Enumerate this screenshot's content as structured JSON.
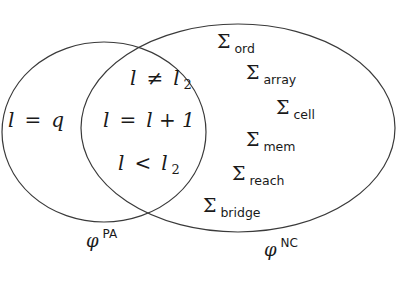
{
  "diagram": {
    "type": "venn",
    "sets": [
      {
        "name": "phi_PA",
        "label_base": "φ",
        "label_sup": "PA",
        "exclusive_members": [
          "l = q"
        ]
      },
      {
        "name": "phi_NC",
        "label_base": "φ",
        "label_sup": "NC",
        "exclusive_members": [
          {
            "base": "Σ",
            "sub": "ord"
          },
          {
            "base": "Σ",
            "sub": "array"
          },
          {
            "base": "Σ",
            "sub": "cell"
          },
          {
            "base": "Σ",
            "sub": "mem"
          },
          {
            "base": "Σ",
            "sub": "reach"
          },
          {
            "base": "Σ",
            "sub": "bridge"
          }
        ]
      }
    ],
    "intersection": [
      {
        "lhs": "l",
        "op": "≠",
        "rhs": "l",
        "rhs_sub": "2"
      },
      {
        "lhs": "l",
        "op": "=",
        "rhs": "l + 1",
        "rhs_sub": ""
      },
      {
        "lhs": "l",
        "op": "<",
        "rhs": "l",
        "rhs_sub": "2"
      }
    ],
    "left_only": {
      "lhs": "l",
      "op": "=",
      "rhs": "q"
    },
    "colors": {
      "stroke": "#3a3a3a",
      "text": "#1a1a1a",
      "background": "#ffffff"
    }
  }
}
